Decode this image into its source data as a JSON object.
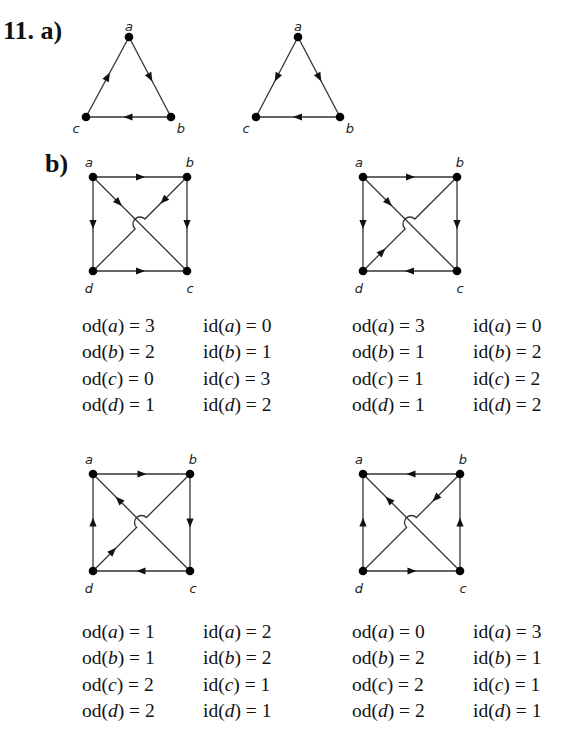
{
  "problem": {
    "number_label": "11. a)",
    "part_b_label": "b)"
  },
  "part_a": {
    "graphs": [
      {
        "name": "triangle-1",
        "vertices": [
          "a",
          "b",
          "c"
        ],
        "edges": [
          [
            "a",
            "b"
          ],
          [
            "b",
            "c"
          ],
          [
            "c",
            "a"
          ]
        ]
      },
      {
        "name": "triangle-2",
        "vertices": [
          "a",
          "b",
          "c"
        ],
        "edges": [
          [
            "a",
            "b"
          ],
          [
            "a",
            "c"
          ],
          [
            "b",
            "c"
          ]
        ]
      }
    ]
  },
  "part_b": {
    "graphs": [
      {
        "name": "square-1",
        "vertices": [
          "a",
          "b",
          "c",
          "d"
        ],
        "edges": [
          [
            "a",
            "b"
          ],
          [
            "a",
            "d"
          ],
          [
            "a",
            "c"
          ],
          [
            "b",
            "d"
          ],
          [
            "b",
            "c"
          ],
          [
            "d",
            "c"
          ]
        ],
        "degrees": [
          {
            "v": "a",
            "od": "3",
            "id": "0"
          },
          {
            "v": "b",
            "od": "2",
            "id": "1"
          },
          {
            "v": "c",
            "od": "0",
            "id": "3"
          },
          {
            "v": "d",
            "od": "1",
            "id": "2"
          }
        ]
      },
      {
        "name": "square-2",
        "vertices": [
          "a",
          "b",
          "c",
          "d"
        ],
        "edges": [
          [
            "a",
            "b"
          ],
          [
            "a",
            "d"
          ],
          [
            "a",
            "c"
          ],
          [
            "d",
            "b"
          ],
          [
            "b",
            "c"
          ],
          [
            "c",
            "d"
          ]
        ],
        "degrees": [
          {
            "v": "a",
            "od": "3",
            "id": "0"
          },
          {
            "v": "b",
            "od": "1",
            "id": "2"
          },
          {
            "v": "c",
            "od": "1",
            "id": "2"
          },
          {
            "v": "d",
            "od": "1",
            "id": "2"
          }
        ]
      },
      {
        "name": "square-3",
        "vertices": [
          "a",
          "b",
          "c",
          "d"
        ],
        "edges": [
          [
            "a",
            "b"
          ],
          [
            "d",
            "a"
          ],
          [
            "c",
            "a"
          ],
          [
            "d",
            "b"
          ],
          [
            "b",
            "c"
          ],
          [
            "c",
            "d"
          ]
        ],
        "degrees": [
          {
            "v": "a",
            "od": "1",
            "id": "2"
          },
          {
            "v": "b",
            "od": "1",
            "id": "2"
          },
          {
            "v": "c",
            "od": "2",
            "id": "1"
          },
          {
            "v": "d",
            "od": "2",
            "id": "1"
          }
        ]
      },
      {
        "name": "square-4",
        "vertices": [
          "a",
          "b",
          "c",
          "d"
        ],
        "edges": [
          [
            "b",
            "a"
          ],
          [
            "d",
            "a"
          ],
          [
            "c",
            "a"
          ],
          [
            "b",
            "d"
          ],
          [
            "c",
            "b"
          ],
          [
            "d",
            "c"
          ]
        ],
        "degrees": [
          {
            "v": "a",
            "od": "0",
            "id": "3"
          },
          {
            "v": "b",
            "od": "2",
            "id": "1"
          },
          {
            "v": "c",
            "od": "2",
            "id": "1"
          },
          {
            "v": "d",
            "od": "2",
            "id": "1"
          }
        ]
      }
    ],
    "notation": {
      "out_degree": "od",
      "in_degree": "id",
      "equals": "="
    }
  }
}
